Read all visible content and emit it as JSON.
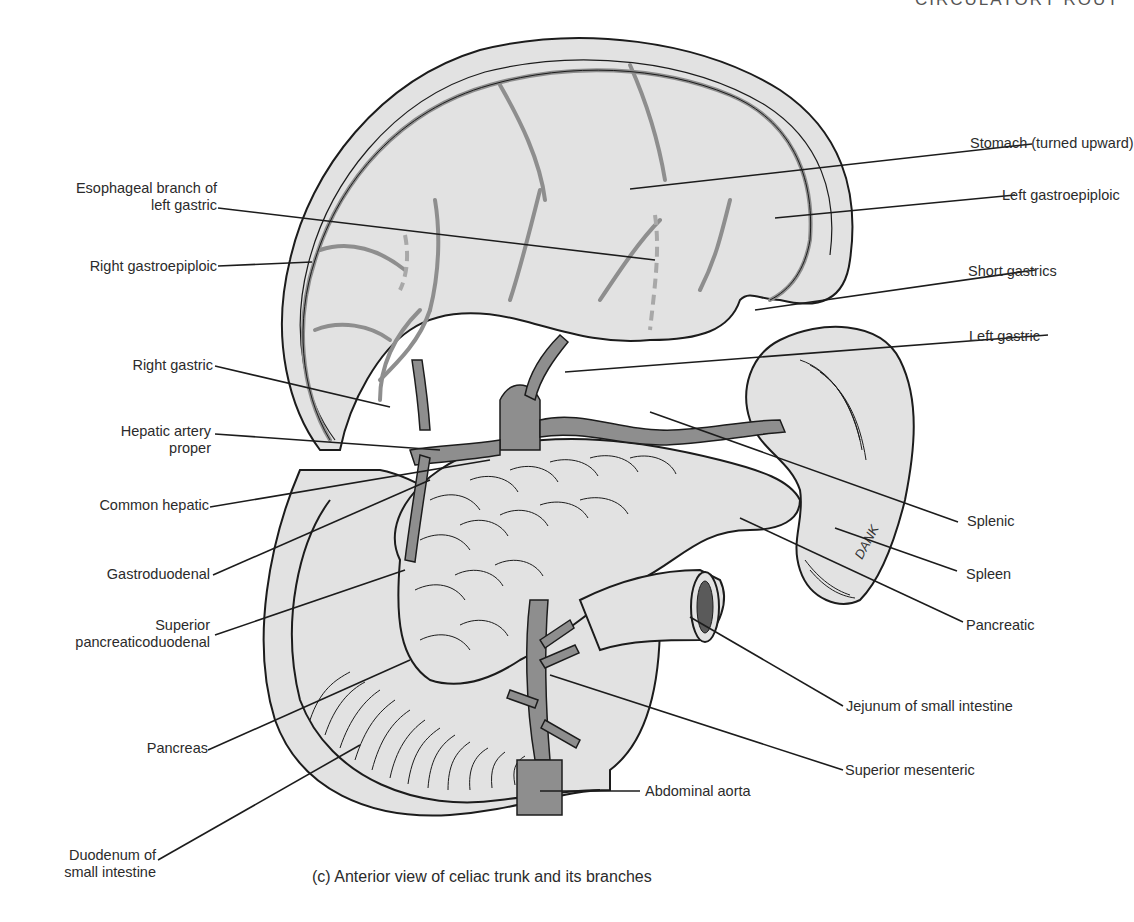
{
  "header_fragment": "CIRCULATORY ROUT",
  "caption": "(c)  Anterior view of celiac trunk and its branches",
  "signature": "DANK",
  "colors": {
    "organ_fill": "#e2e2e2",
    "vessel_fill": "#8e8e8e",
    "outline": "#1c1c1c",
    "dashed_vessel": "#a8a8a8",
    "background": "#ffffff"
  },
  "labels_left": [
    {
      "id": "esophageal-branch",
      "lines": [
        "Esophageal branch of",
        "left gastric"
      ]
    },
    {
      "id": "right-gastroepiploic",
      "lines": [
        "Right gastroepiploic"
      ]
    },
    {
      "id": "right-gastric",
      "lines": [
        "Right gastric"
      ]
    },
    {
      "id": "hepatic-artery-proper",
      "lines": [
        "Hepatic artery",
        "proper"
      ]
    },
    {
      "id": "common-hepatic",
      "lines": [
        "Common hepatic"
      ]
    },
    {
      "id": "gastroduodenal",
      "lines": [
        "Gastroduodenal"
      ]
    },
    {
      "id": "superior-pancreaticoduodenal",
      "lines": [
        "Superior",
        "pancreaticoduodenal"
      ]
    },
    {
      "id": "pancreas",
      "lines": [
        "Pancreas"
      ]
    },
    {
      "id": "duodenum",
      "lines": [
        "Duodenum of",
        "small intestine"
      ]
    }
  ],
  "labels_right": [
    {
      "id": "stomach",
      "lines": [
        "Stomach (turned upward)"
      ]
    },
    {
      "id": "left-gastroepiploic",
      "lines": [
        "Left gastroepiploic"
      ]
    },
    {
      "id": "short-gastrics",
      "lines": [
        "Short gastrics"
      ]
    },
    {
      "id": "left-gastric",
      "lines": [
        "Left gastric"
      ]
    },
    {
      "id": "splenic",
      "lines": [
        "Splenic"
      ]
    },
    {
      "id": "spleen",
      "lines": [
        "Spleen"
      ]
    },
    {
      "id": "pancreatic",
      "lines": [
        "Pancreatic"
      ]
    },
    {
      "id": "jejunum",
      "lines": [
        "Jejunum of small intestine"
      ]
    },
    {
      "id": "superior-mesenteric",
      "lines": [
        "Superior mesenteric"
      ]
    },
    {
      "id": "abdominal-aorta",
      "lines": [
        "Abdominal aorta"
      ]
    }
  ]
}
